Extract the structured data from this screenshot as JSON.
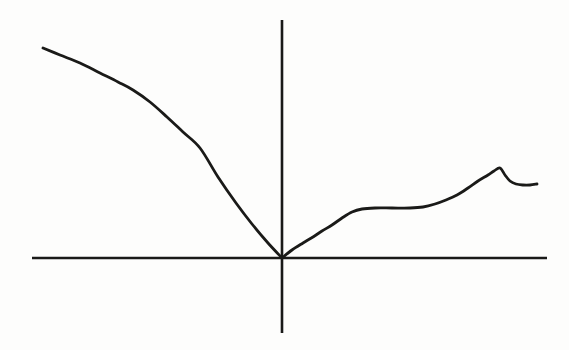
{
  "figure": {
    "kind": "cartesian-axes-function-plot",
    "width": 569,
    "height": 350,
    "background_color": "#fdfdfc",
    "ink_color": "#1a1a18",
    "title": "",
    "caption": "",
    "has_labels": false,
    "has_tick_marks": false,
    "has_gridlines": false,
    "has_legend": false,
    "has_axis_arrowheads": false
  },
  "chart_data": {
    "type": "line",
    "title": "",
    "subtitle": "",
    "xlabel": "",
    "ylabel": "",
    "xlim": [
      -4.2,
      4.2
    ],
    "ylim": [
      -1.05,
      2.35
    ],
    "grid": false,
    "legend": false,
    "legend_position": "none",
    "tick_labels_x": [],
    "tick_labels_y": [],
    "annotations": [],
    "axes": {
      "x_axis": {
        "name": "x-axis",
        "orientation": "horizontal",
        "y_pixel": 258,
        "x_start_pixel": 32,
        "x_end_pixel": 547,
        "stroke_width": 2.6,
        "color": "#1a1a18"
      },
      "y_axis": {
        "name": "y-axis",
        "orientation": "vertical",
        "x_pixel": 282,
        "y_start_pixel": 20,
        "y_end_pixel": 333,
        "stroke_width": 2.6,
        "color": "#1a1a18"
      },
      "origin_pixel": [
        282,
        258
      ]
    },
    "series": [
      {
        "name": "curve-left-branch",
        "description": "Concave-down decreasing curve in the second quadrant; begins high at upper left, steepens, and descends to meet the origin with a steep negative slope (corner at origin).",
        "color": "#1a1a18",
        "stroke_width": 2.8,
        "smooth": true,
        "points_pixel": [
          [
            43,
            48
          ],
          [
            60,
            55
          ],
          [
            80,
            63
          ],
          [
            100,
            73
          ],
          [
            118,
            82
          ],
          [
            133,
            90
          ],
          [
            150,
            102
          ],
          [
            167,
            117
          ],
          [
            183,
            132
          ],
          [
            200,
            148
          ],
          [
            218,
            177
          ],
          [
            236,
            203
          ],
          [
            252,
            224
          ],
          [
            268,
            243
          ],
          [
            282,
            258
          ]
        ]
      },
      {
        "name": "curve-right-branch",
        "description": "Rises from the origin with decreasing slope, levels off to a horizontal plateau, rises again to a sharp cusp peak, drops sharply, then levels off to a short flat tail.",
        "color": "#1a1a18",
        "stroke_width": 2.8,
        "smooth": true,
        "points_pixel": [
          [
            282,
            258
          ],
          [
            292,
            250
          ],
          [
            303,
            243
          ],
          [
            313,
            237
          ],
          [
            322,
            231
          ],
          [
            332,
            225
          ],
          [
            342,
            218
          ],
          [
            352,
            212
          ],
          [
            362,
            209
          ],
          [
            375,
            208
          ],
          [
            392,
            208
          ],
          [
            410,
            208
          ],
          [
            423,
            207
          ],
          [
            435,
            204
          ],
          [
            446,
            200
          ],
          [
            457,
            195
          ],
          [
            468,
            188
          ],
          [
            478,
            181
          ],
          [
            488,
            175
          ],
          [
            494,
            171
          ],
          [
            500,
            168
          ],
          [
            505,
            175
          ],
          [
            510,
            181
          ],
          [
            516,
            184
          ],
          [
            523,
            185
          ],
          [
            530,
            185
          ],
          [
            537,
            184
          ]
        ]
      }
    ],
    "features": [
      {
        "name": "origin-corner",
        "pixel": [
          282,
          258
        ],
        "kind": "corner"
      },
      {
        "name": "plateau-start",
        "pixel": [
          365,
          208
        ],
        "kind": "inflection"
      },
      {
        "name": "plateau-end",
        "pixel": [
          423,
          207
        ],
        "kind": "inflection"
      },
      {
        "name": "cusp-peak",
        "pixel": [
          500,
          168
        ],
        "kind": "local-maximum"
      },
      {
        "name": "right-tail",
        "pixel": [
          537,
          184
        ],
        "kind": "endpoint"
      },
      {
        "name": "left-endpoint",
        "pixel": [
          43,
          48
        ],
        "kind": "endpoint"
      }
    ]
  }
}
